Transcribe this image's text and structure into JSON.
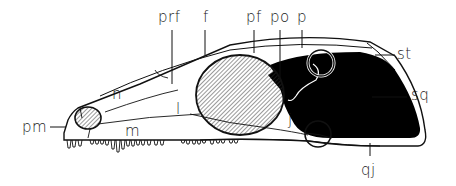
{
  "figure": {
    "type": "anatomical-diagram",
    "colors": {
      "ink": "#111111",
      "background": "#ffffff",
      "fenestra_fill": "#000000",
      "orbit_hatch": "#333333"
    },
    "labels": [
      {
        "id": "prf",
        "text": "prf",
        "x": 158,
        "y": 10
      },
      {
        "id": "f",
        "text": "f",
        "x": 203,
        "y": 10
      },
      {
        "id": "pf",
        "text": "pf",
        "x": 246,
        "y": 10
      },
      {
        "id": "po",
        "text": "po",
        "x": 270,
        "y": 10
      },
      {
        "id": "p",
        "text": "p",
        "x": 297,
        "y": 10
      },
      {
        "id": "st",
        "text": "st",
        "x": 397,
        "y": 47
      },
      {
        "id": "sq",
        "text": "sq",
        "x": 411,
        "y": 88
      },
      {
        "id": "qj",
        "text": "qj",
        "x": 361,
        "y": 163
      },
      {
        "id": "pm",
        "text": "pm",
        "x": 22,
        "y": 120
      },
      {
        "id": "n",
        "text": "n",
        "x": 112,
        "y": 87
      },
      {
        "id": "l",
        "text": "l",
        "x": 176,
        "y": 102
      },
      {
        "id": "m",
        "text": "m",
        "x": 125,
        "y": 124
      },
      {
        "id": "j",
        "text": "j",
        "x": 288,
        "y": 113
      }
    ]
  }
}
